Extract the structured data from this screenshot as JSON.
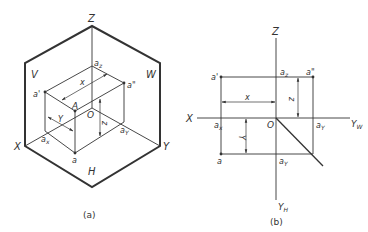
{
  "figure_a": {
    "caption": "(a)",
    "planes": {
      "V": "V",
      "W": "W",
      "H": "H"
    },
    "axes": {
      "X": "X",
      "Y": "Y",
      "Z": "Z"
    },
    "points": {
      "origin": "O",
      "A": "A",
      "a_prime": "a'",
      "a_double_prime": "a\"",
      "a": "a",
      "a_x": "a",
      "a_x_sub": "x",
      "a_y": "a",
      "a_y_sub": "Y",
      "a_z": "a",
      "a_z_sub": "z"
    },
    "dimensions": {
      "x": "x",
      "y": "Y",
      "z": "z"
    }
  },
  "figure_b": {
    "caption": "(b)",
    "axes": {
      "X": "X",
      "Z": "Z",
      "Y_W": "Y",
      "Y_W_sub": "W",
      "Y_H": "Y",
      "Y_H_sub": "H"
    },
    "points": {
      "origin": "O",
      "a_prime": "a'",
      "a_double_prime": "a\"",
      "a": "a",
      "a_x": "a",
      "a_x_sub": "x",
      "a_z": "a",
      "a_z_sub": "z",
      "a_y_w": "a",
      "a_y_w_sub": "Y",
      "a_y_h": "a",
      "a_y_h_sub": "Y"
    },
    "dimensions": {
      "x": "x",
      "y": "Y",
      "z": "z"
    }
  },
  "colors": {
    "line": "#333333",
    "background": "#ffffff"
  }
}
